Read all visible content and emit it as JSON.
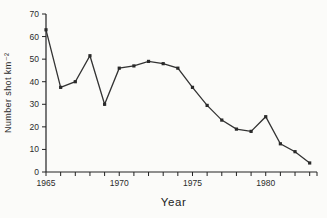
{
  "figure": {
    "background": "#fbfbf9",
    "ink": "#222222",
    "line_color": "#333333",
    "marker_color": "#2a2a2a"
  },
  "chart_data": {
    "type": "line",
    "title": "",
    "xlabel": "Year",
    "ylabel": "Number shot km⁻²",
    "x": [
      1965,
      1966,
      1967,
      1968,
      1969,
      1970,
      1971,
      1972,
      1973,
      1974,
      1975,
      1976,
      1977,
      1978,
      1979,
      1980,
      1981,
      1982,
      1983
    ],
    "values": [
      63,
      37.5,
      40,
      51.5,
      30,
      46,
      47,
      49,
      48,
      46,
      37.5,
      29.5,
      23,
      19,
      18,
      24.5,
      12.5,
      9,
      4
    ],
    "xlim": [
      1965,
      1983.5
    ],
    "ylim": [
      0,
      70
    ],
    "yticks": [
      0,
      10,
      20,
      30,
      40,
      50,
      60,
      70
    ],
    "xtick_labels": [
      "1965",
      "1970",
      "1975",
      "1980"
    ],
    "xtick_label_years": [
      1965,
      1970,
      1975,
      1980
    ],
    "xtick_minor_interval_years": 1,
    "marker": "square",
    "grid": false,
    "legend": null
  }
}
